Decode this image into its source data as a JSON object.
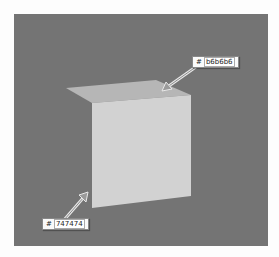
{
  "diagram": {
    "background_color": "#747474",
    "cube": {
      "top_face_color": "#b6b6b6",
      "front_face_color": "#d2d2d2"
    },
    "labels": [
      {
        "id": "top",
        "hash": "#",
        "value": "b6b6b6"
      },
      {
        "id": "background",
        "hash": "#",
        "value": "747474"
      }
    ]
  }
}
